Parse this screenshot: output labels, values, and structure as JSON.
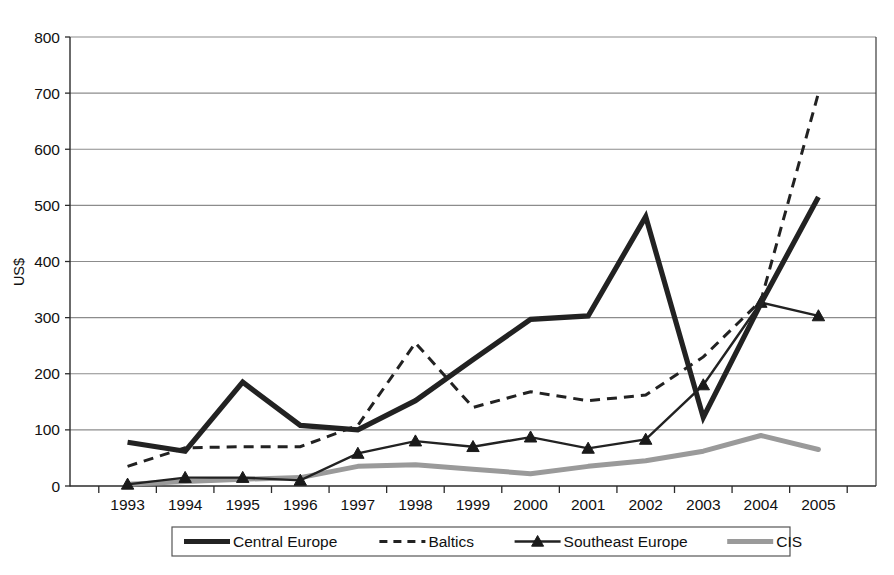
{
  "chart_data": {
    "type": "line",
    "title": "",
    "xlabel": "",
    "ylabel": "US$",
    "x": [
      1993,
      1994,
      1995,
      1996,
      1997,
      1998,
      1999,
      2000,
      2001,
      2002,
      2003,
      2004,
      2005
    ],
    "categories": [
      "1993",
      "1994",
      "1995",
      "1996",
      "1997",
      "1998",
      "1999",
      "2000",
      "2001",
      "2002",
      "2003",
      "2004",
      "2005"
    ],
    "ylim": [
      0,
      800
    ],
    "xlim": [
      1993,
      2005
    ],
    "y_ticks": [
      0,
      100,
      200,
      300,
      400,
      500,
      600,
      700,
      800
    ],
    "y_tick_labels": [
      "0",
      "100",
      "200",
      "300",
      "400",
      "500",
      "600",
      "700",
      "800"
    ],
    "grid": true,
    "legend_position": "bottom",
    "series": [
      {
        "name": "Central Europe",
        "style": "solid-thick",
        "color": "#222222",
        "values": [
          78,
          62,
          185,
          108,
          100,
          152,
          225,
          297,
          303,
          480,
          122,
          325,
          515
        ]
      },
      {
        "name": "Baltics",
        "style": "dashed",
        "color": "#222222",
        "values": [
          35,
          68,
          70,
          70,
          108,
          255,
          140,
          168,
          152,
          162,
          230,
          330,
          700
        ]
      },
      {
        "name": "Southeast Europe",
        "style": "solid-marker-triangle",
        "color": "#222222",
        "values": [
          3,
          15,
          15,
          10,
          58,
          80,
          70,
          87,
          67,
          83,
          180,
          327,
          303
        ]
      },
      {
        "name": "CIS",
        "style": "solid-gray",
        "color": "#9a9a9a",
        "values": [
          3,
          8,
          12,
          15,
          35,
          38,
          30,
          22,
          35,
          45,
          62,
          90,
          65
        ]
      }
    ]
  },
  "axes": {
    "y_title": "US$",
    "y_tick_labels": [
      "800",
      "700",
      "600",
      "500",
      "400",
      "300",
      "200",
      "100",
      "0"
    ],
    "x_tick_labels": [
      "1993",
      "1994",
      "1995",
      "1996",
      "1997",
      "1998",
      "1999",
      "2000",
      "2001",
      "2002",
      "2003",
      "2004",
      "2005"
    ]
  },
  "legend": {
    "items": [
      {
        "label": "Central Europe",
        "icon": "thick-solid-line-swatch"
      },
      {
        "label": "Baltics",
        "icon": "dashed-line-swatch"
      },
      {
        "label": "Southeast Europe",
        "icon": "line-triangle-marker-swatch"
      },
      {
        "label": "CIS",
        "icon": "gray-solid-line-swatch"
      }
    ]
  }
}
